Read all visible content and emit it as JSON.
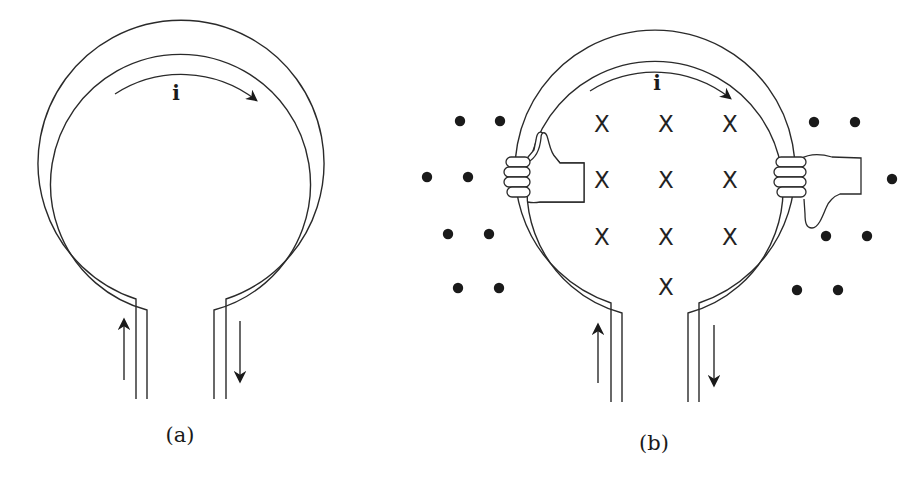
{
  "figure": {
    "panels": [
      {
        "id": "a",
        "caption": "(a)",
        "current_label": "i",
        "description": "Circular wire loop with two parallel leads; current i flows clockwise around the loop, up the left lead and down the right lead"
      },
      {
        "id": "b",
        "caption": "(b)",
        "current_label": "i",
        "description": "Same loop with right-hand-rule hands: left hand thumb up, right hand thumb down; magnetic field into page inside loop (X), out of page outside (dots)",
        "field_inside_symbol": "X",
        "field_outside_symbol": "•",
        "inside_x_marks": [
          {
            "x": 602,
            "y": 124
          },
          {
            "x": 666,
            "y": 124
          },
          {
            "x": 730,
            "y": 124
          },
          {
            "x": 602,
            "y": 180
          },
          {
            "x": 666,
            "y": 180
          },
          {
            "x": 730,
            "y": 180
          },
          {
            "x": 602,
            "y": 237
          },
          {
            "x": 666,
            "y": 237
          },
          {
            "x": 730,
            "y": 237
          },
          {
            "x": 666,
            "y": 287
          }
        ],
        "outside_dots": [
          {
            "x": 460,
            "y": 121
          },
          {
            "x": 500,
            "y": 121
          },
          {
            "x": 427,
            "y": 177
          },
          {
            "x": 468,
            "y": 177
          },
          {
            "x": 448,
            "y": 234
          },
          {
            "x": 489,
            "y": 234
          },
          {
            "x": 458,
            "y": 288
          },
          {
            "x": 499,
            "y": 288
          },
          {
            "x": 814,
            "y": 122
          },
          {
            "x": 855,
            "y": 122
          },
          {
            "x": 892,
            "y": 179
          },
          {
            "x": 826,
            "y": 236
          },
          {
            "x": 867,
            "y": 236
          },
          {
            "x": 797,
            "y": 290
          },
          {
            "x": 838,
            "y": 290
          }
        ],
        "hands": [
          {
            "side": "left",
            "thumb": "up"
          },
          {
            "side": "right",
            "thumb": "down"
          }
        ]
      }
    ],
    "colors": {
      "line": "#2a2a2a",
      "fill": "#1a1a1a",
      "background": "#ffffff"
    }
  }
}
